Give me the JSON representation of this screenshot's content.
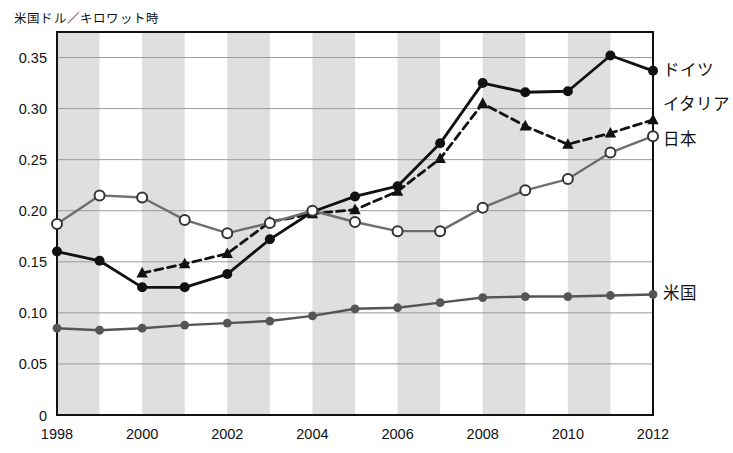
{
  "chart_data": {
    "type": "line",
    "title": "",
    "ylabel": "米国ドル／キロワット時",
    "xlabel": "",
    "ylim": [
      0,
      0.375
    ],
    "xlim": [
      1998,
      2012
    ],
    "yticks": [
      "0",
      "0.05",
      "0.10",
      "0.15",
      "0.20",
      "0.25",
      "0.30",
      "0.35"
    ],
    "ytick_values": [
      0,
      0.05,
      0.1,
      0.15,
      0.2,
      0.25,
      0.3,
      0.35
    ],
    "xticks": [
      "1998",
      "2000",
      "2002",
      "2004",
      "2006",
      "2008",
      "2010",
      "2012"
    ],
    "x": [
      1998,
      1999,
      2000,
      2001,
      2002,
      2003,
      2004,
      2005,
      2006,
      2007,
      2008,
      2009,
      2010,
      2011,
      2012
    ],
    "grid": "horizontal",
    "band_shading": "alternating vertical gray bands",
    "legend_position": "right-inline",
    "series": [
      {
        "name": "ドイツ",
        "marker": "filled-circle",
        "line": "solid",
        "color": "#111111",
        "values": [
          0.16,
          0.151,
          0.125,
          0.125,
          0.138,
          0.172,
          0.199,
          0.214,
          0.224,
          0.266,
          0.325,
          0.316,
          0.317,
          0.352,
          0.337
        ]
      },
      {
        "name": "イタリア",
        "marker": "filled-triangle",
        "line": "dashed",
        "color": "#111111",
        "values": [
          null,
          null,
          0.139,
          0.148,
          0.158,
          0.189,
          0.197,
          0.201,
          0.219,
          0.251,
          0.305,
          0.283,
          0.265,
          0.276,
          0.289
        ]
      },
      {
        "name": "日本",
        "marker": "open-circle",
        "line": "solid",
        "color": "#6e6e6e",
        "values": [
          0.187,
          0.215,
          0.213,
          0.191,
          0.178,
          0.188,
          0.2,
          0.189,
          0.18,
          0.18,
          0.203,
          0.22,
          0.231,
          0.257,
          0.273
        ]
      },
      {
        "name": "米国",
        "marker": "filled-circle-gray",
        "line": "solid",
        "color": "#555555",
        "values": [
          0.085,
          0.083,
          0.085,
          0.088,
          0.09,
          0.092,
          0.097,
          0.104,
          0.105,
          0.11,
          0.115,
          0.116,
          0.116,
          0.117,
          0.118
        ]
      }
    ],
    "colors": {
      "germany": "#111111",
      "italy": "#111111",
      "japan": "#6e6e6e",
      "usa": "#555555",
      "band": "#d9d9d9",
      "grid": "#9a9a9a",
      "frame": "#111111"
    }
  }
}
